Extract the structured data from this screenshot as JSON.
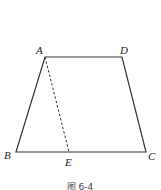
{
  "figure": {
    "caption": "图 6-4",
    "shape": "trapezoid",
    "vertices": {
      "A": {
        "label": "A",
        "x": 45,
        "y": 57
      },
      "D": {
        "label": "D",
        "x": 122,
        "y": 57
      },
      "B": {
        "label": "B",
        "x": 16,
        "y": 152
      },
      "C": {
        "label": "C",
        "x": 146,
        "y": 152
      },
      "E": {
        "label": "E",
        "x": 69,
        "y": 152
      }
    },
    "segments": [
      {
        "from": "A",
        "to": "D",
        "style": "solid"
      },
      {
        "from": "D",
        "to": "C",
        "style": "solid"
      },
      {
        "from": "C",
        "to": "B",
        "style": "solid"
      },
      {
        "from": "B",
        "to": "A",
        "style": "solid"
      },
      {
        "from": "A",
        "to": "E",
        "style": "dashed"
      }
    ],
    "colors": {
      "stroke": "#333333",
      "background": "#ffffff"
    }
  }
}
